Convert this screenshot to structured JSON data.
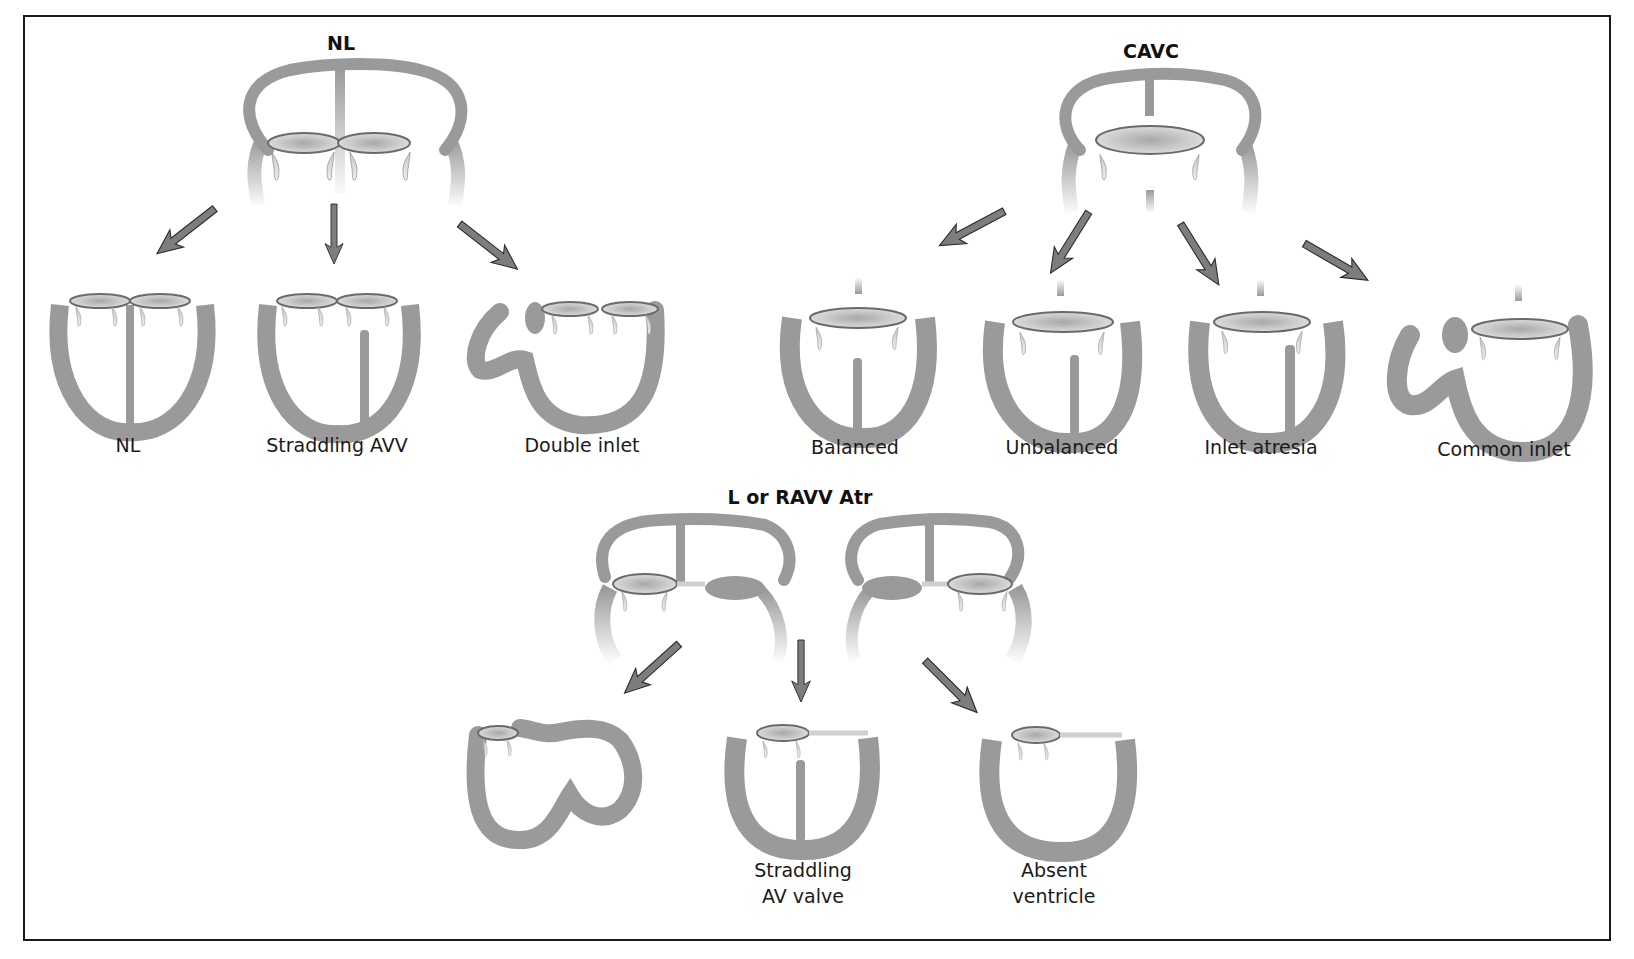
{
  "diagram": {
    "groups": [
      {
        "title": "NL",
        "outcomes": [
          "NL",
          "Straddling AVV",
          "Double inlet"
        ]
      },
      {
        "title": "CAVC",
        "outcomes": [
          "Balanced",
          "Unbalanced",
          "Inlet atresia",
          "Common inlet"
        ]
      },
      {
        "title": "L or RAVV Atr",
        "outcomes": [
          "",
          "Straddling\nAV valve",
          "Absent\nventricle"
        ]
      }
    ],
    "colors": {
      "tissue": "#9a9a9a",
      "arrow_fill": "#7d7d7d",
      "arrow_stroke": "#2a2a2a",
      "valve_edge": "#6a6a6a",
      "border": "#1a1a1a",
      "text": "#1a1a1a"
    }
  }
}
